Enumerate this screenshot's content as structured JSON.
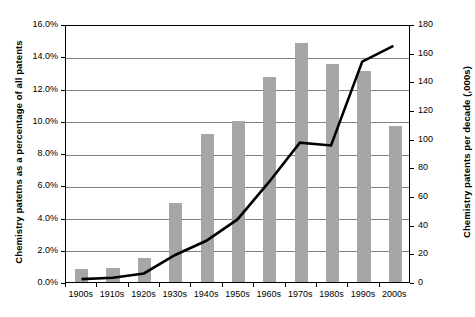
{
  "chart_data": {
    "type": "bar",
    "title": "",
    "subtitle": "",
    "xlabel": "",
    "ylabel": "Chemistry patetns as a percentage of all patents",
    "ylabel_right": "Chemistry patents per decade (,000s)",
    "categories": [
      "1900s",
      "1910s",
      "1920s",
      "1930s",
      "1940s",
      "1950s",
      "1960s",
      "1970s",
      "1980s",
      "1990s",
      "2000s"
    ],
    "ylim": [
      0,
      16
    ],
    "ylim_right": [
      0,
      180
    ],
    "ytick_labels": [
      "0.0%",
      "2.0%",
      "4.0%",
      "6.0%",
      "8.0%",
      "10.0%",
      "12.0%",
      "14.0%",
      "16.0%"
    ],
    "ytick_values": [
      0,
      2,
      4,
      6,
      8,
      10,
      12,
      14,
      16
    ],
    "ytick_right_labels": [
      "0",
      "20",
      "40",
      "60",
      "80",
      "100",
      "120",
      "140",
      "160",
      "180"
    ],
    "ytick_right_values": [
      0,
      20,
      40,
      60,
      80,
      100,
      120,
      140,
      160,
      180
    ],
    "grid": true,
    "legend": "none",
    "series": [
      {
        "name": "Chemistry patents as a percentage of all patents",
        "type": "bar",
        "axis": "left",
        "color": "#a6a6a6",
        "values": [
          0.8,
          0.9,
          1.5,
          4.9,
          9.2,
          10.0,
          12.7,
          14.8,
          13.5,
          13.1,
          9.7
        ],
        "data_labels": [
          "0.8%",
          "0.9%",
          "1.5%",
          "4.9%",
          "9.2%",
          "10.0%",
          "12.7%",
          "14.8%",
          "13.5%",
          "13.1%",
          "9.7%"
        ]
      },
      {
        "name": "Chemistry patents per decade (,000s)",
        "type": "line",
        "axis": "right",
        "color": "#000000",
        "values": [
          2,
          3,
          6,
          19,
          29,
          44,
          70,
          98,
          96,
          155,
          166
        ]
      }
    ]
  }
}
